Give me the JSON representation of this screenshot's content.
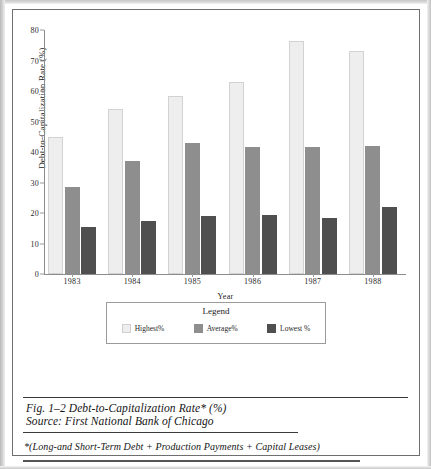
{
  "figure": {
    "caption_title": "Fig. 1–2 Debt-to-Capitalization Rate* (%)",
    "caption_source": "Source: First National Bank of Chicago",
    "footnote": "*(Long-and Short-Term Debt + Production Payments + Capital Leases)"
  },
  "legend": {
    "title": "Legend",
    "items": [
      {
        "label": "Highest%",
        "color": "#eeeeee"
      },
      {
        "label": "Average%",
        "color": "#8e8e8e"
      },
      {
        "label": "Lowest %",
        "color": "#4f4f4f"
      }
    ]
  },
  "chart_data": {
    "type": "bar",
    "title": "",
    "xlabel": "Year",
    "ylabel": "Debt-to-Capitalization Rate (%)",
    "categories": [
      "1983",
      "1984",
      "1985",
      "1986",
      "1987",
      "1988"
    ],
    "series": [
      {
        "name": "Highest%",
        "color": "#eeeeee",
        "values": [
          45,
          54,
          58.5,
          63,
          76.5,
          73
        ]
      },
      {
        "name": "Average%",
        "color": "#8e8e8e",
        "values": [
          28.5,
          37,
          43,
          41.5,
          41.5,
          42
        ]
      },
      {
        "name": "Lowest %",
        "color": "#4f4f4f",
        "values": [
          15.5,
          17.5,
          19,
          19.5,
          18.5,
          22
        ]
      }
    ],
    "ylim": [
      0,
      80
    ],
    "yticks": [
      0,
      10,
      20,
      30,
      40,
      50,
      60,
      70,
      80
    ],
    "ytick_labels": [
      "0",
      "10",
      "20",
      "30",
      "40",
      "50",
      "60",
      "70",
      "80"
    ],
    "grid": false,
    "legend_position": "below-axes"
  }
}
